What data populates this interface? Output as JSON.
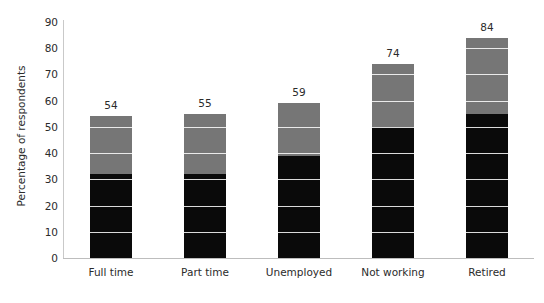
{
  "title": {
    "text": "",
    "note": "chart title is cropped off the top edge of the screenshot"
  },
  "chart_data": {
    "type": "bar",
    "subtype": "stacked-bar",
    "title": "",
    "xlabel": "",
    "ylabel": "Percentage of respondents",
    "ylim": [
      0,
      90
    ],
    "ytick_step": 10,
    "yticks": [
      "0",
      "10",
      "20",
      "30",
      "40",
      "50",
      "60",
      "70",
      "80",
      "90"
    ],
    "grid": true,
    "grid_color": "#ffffff",
    "legend": "none",
    "categories": [
      "Full time",
      "Part time",
      "Unemployed",
      "Not working",
      "Retired"
    ],
    "series": [
      {
        "name": "lower-segment",
        "color": "#0a0a0a",
        "values": [
          32,
          32,
          39,
          50,
          55
        ]
      },
      {
        "name": "upper-segment",
        "color": "#767676",
        "values": [
          22,
          23,
          20,
          24,
          29
        ]
      }
    ],
    "totals": [
      54,
      55,
      59,
      74,
      84
    ],
    "data_labels": [
      "54",
      "55",
      "59",
      "74",
      "84"
    ]
  },
  "colors": {
    "lower": "#0a0a0a",
    "upper": "#767676",
    "axis": "#bdbdbd",
    "grid": "#ffffff",
    "text": "#2b2b2b",
    "background": "#ffffff"
  }
}
